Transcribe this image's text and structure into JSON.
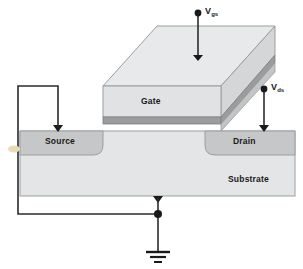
{
  "figure": {
    "type": "semiconductor-device-diagram"
  },
  "labels": {
    "gate": "Gate",
    "source": "Source",
    "drain": "Drain",
    "substrate": "Substrate",
    "vgs_symbol": "V",
    "vgs_subscript": "gs",
    "vds_symbol": "V",
    "vds_subscript": "ds"
  },
  "icons": {
    "ground": "ground-symbol",
    "junction": "junction-dot",
    "terminal_vgs": "terminal-dot",
    "terminal_vds": "terminal-dot",
    "contact_source": "contact-triangle",
    "contact_drain": "contact-triangle",
    "contact_substrate": "contact-triangle",
    "contact_gate": "contact-triangle",
    "marker_left": "tan-marker"
  },
  "colors": {
    "substrate_fill": "#e3e5e6",
    "diffusion_fill": "#c9cbcc",
    "gate_front_fill": "#e0e2e3",
    "gate_top_fill": "#e6e8e9",
    "gate_side_fill": "#d2d4d5",
    "oxide_fill": "#9a9c9d",
    "outline": "#8d9091",
    "wire": "#2b2b2b",
    "text": "#1a1a1a",
    "marker": "#e8d9b0"
  },
  "nodes": {
    "vgs_terminal": {
      "x": 198,
      "y": 13
    },
    "vds_terminal": {
      "x": 264,
      "y": 89
    },
    "ground": {
      "x": 158,
      "y": 252
    },
    "junction": {
      "x": 158,
      "y": 214
    }
  }
}
